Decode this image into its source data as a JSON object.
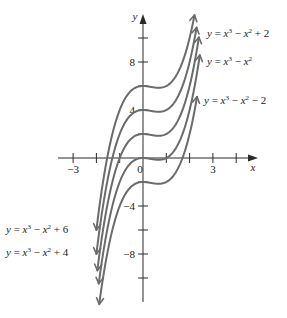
{
  "chart_data": {
    "type": "line",
    "title": "",
    "xlabel": "x",
    "ylabel": "y",
    "xlim": [
      -3.5,
      5
    ],
    "ylim": [
      -12.5,
      12.5
    ],
    "grid": false,
    "x_ticks": [
      -3,
      -2,
      -1,
      0,
      1,
      2,
      3,
      4
    ],
    "x_tick_labels": [
      {
        "value": -3,
        "label": "−3"
      },
      {
        "value": 0,
        "label": "0"
      },
      {
        "value": 3,
        "label": "3"
      }
    ],
    "y_ticks": [
      -10,
      -8,
      -6,
      -4,
      -2,
      2,
      4,
      6,
      8,
      10
    ],
    "y_tick_labels": [
      {
        "value": 8,
        "label": "8"
      },
      {
        "value": 4,
        "label": "4"
      },
      {
        "value": -4,
        "label": "−4"
      },
      {
        "value": -8,
        "label": "−8"
      }
    ],
    "series": [
      {
        "name": "y = x³ − x² + 6",
        "shift": 6,
        "x_range": [
          -2.0,
          2.21
        ],
        "label_side": "bottom-left"
      },
      {
        "name": "y = x³ − x² + 4",
        "shift": 4,
        "x_range": [
          -2.0,
          2.3
        ],
        "label_side": "bottom-left"
      },
      {
        "name": "y = x³ − x² + 2",
        "shift": 2,
        "x_range": [
          -1.96,
          2.4
        ],
        "label_side": "top-right"
      },
      {
        "name": "y = x³ − x²",
        "shift": 0,
        "x_range": [
          -1.9,
          2.44
        ],
        "label_side": "top-right"
      },
      {
        "name": "y = x³ − x² − 2",
        "shift": -2,
        "x_range": [
          -1.88,
          2.32
        ],
        "label_side": "top-right"
      }
    ],
    "colors": {
      "curve": "#6b6b6b",
      "axis": "#2a2a2a",
      "text": "#222222"
    }
  },
  "labels": {
    "y_axis": "y",
    "x_axis": "x",
    "curve_plus2": [
      "y = x",
      "3",
      " − x",
      "2",
      " + 2"
    ],
    "curve_zero": [
      "y = x",
      "3",
      " − x",
      "2",
      ""
    ],
    "curve_minus2": [
      "y = x",
      "3",
      " − x",
      "2",
      " − 2"
    ],
    "curve_plus6": [
      "y = x",
      "3",
      "  −  x",
      "2",
      "  +  6"
    ],
    "curve_plus4": [
      "y = x",
      "3",
      "  −  x",
      "2",
      "  +  4"
    ]
  }
}
